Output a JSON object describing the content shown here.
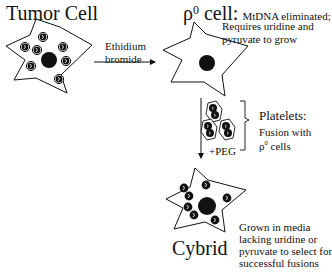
{
  "diagram": {
    "tumor_cell": {
      "title": "Tumor Cell",
      "mito_count": 7
    },
    "step1_arrow": {
      "label_line1": "Ethidium",
      "label_line2": "bromide"
    },
    "rho0_cell": {
      "title_symbol": "ρ",
      "title_superscript": "0",
      "title_word": " cell:",
      "desc_line1": "MtDNA eliminated;",
      "desc_line2": "Requires uridine and",
      "desc_line3": "pyruvate to grow"
    },
    "step2_arrow": {
      "label": "+PEG"
    },
    "platelets": {
      "title": "Platelets:",
      "desc_line1": "Fusion with",
      "desc_symbol": "ρ",
      "desc_superscript": "0",
      "desc_tail": " cells",
      "count": 3
    },
    "cybrid": {
      "title": "Cybrid",
      "mito_count": 7,
      "desc_line1": "Grown in media",
      "desc_line2": "lacking uridine or",
      "desc_line3": "pyruvate to select for",
      "desc_line4": "successful fusions"
    }
  }
}
